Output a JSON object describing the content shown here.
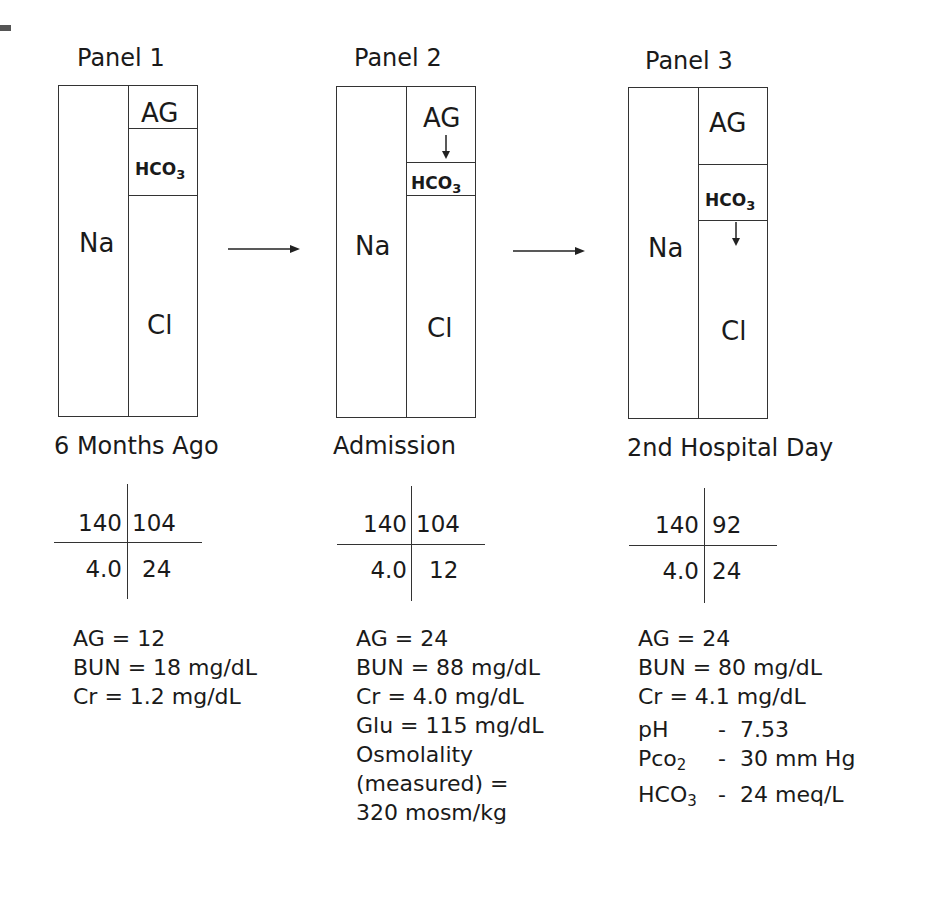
{
  "figure": {
    "panels": [
      {
        "title": "Panel 1",
        "compartments": {
          "left": "Na",
          "top": "AG",
          "middle": "HCO3",
          "bottom": "Cl"
        },
        "caption": "6 Months Ago",
        "electrolytes": {
          "na": "140",
          "cl": "104",
          "k": "4.0",
          "hco3": "24"
        },
        "labs": [
          "AG = 12",
          "BUN = 18 mg/dL",
          "Cr = 1.2 mg/dL"
        ]
      },
      {
        "title": "Panel 2",
        "compartments": {
          "left": "Na",
          "top": "AG",
          "middle": "HCO3",
          "bottom": "Cl"
        },
        "caption": "Admission",
        "electrolytes": {
          "na": "140",
          "cl": "104",
          "k": "4.0",
          "hco3": "12"
        },
        "labs": [
          "AG = 24",
          "BUN = 88 mg/dL",
          "Cr = 4.0 mg/dL",
          "Glu = 115 mg/dL",
          "Osmolality",
          "(measured) =",
          "320 mosm/kg"
        ]
      },
      {
        "title": "Panel 3",
        "compartments": {
          "left": "Na",
          "top": "AG",
          "middle": "HCO3",
          "bottom": "Cl"
        },
        "caption": "2nd Hospital Day",
        "electrolytes": {
          "na": "140",
          "cl": "92",
          "k": "4.0",
          "hco3": "24"
        },
        "labs": [
          "AG = 24",
          "BUN = 80 mg/dL",
          "Cr = 4.1 mg/dL"
        ],
        "abg": [
          {
            "name": "pH",
            "sep": "-",
            "value": "7.53"
          },
          {
            "name": "Pco",
            "sub": "2",
            "sep": "-",
            "value": "30 mm Hg"
          },
          {
            "name": "HCO",
            "sub": "3",
            "sep": "-",
            "value": "24 meq/L"
          }
        ]
      }
    ],
    "hco3_main": "HCO",
    "hco3_sub": "3"
  }
}
